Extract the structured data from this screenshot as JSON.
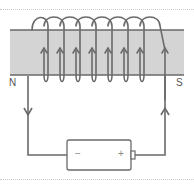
{
  "diagram": {
    "labels": {
      "north": "N",
      "south": "S",
      "negative": "−",
      "positive": "+"
    },
    "coil": {
      "turns": 8,
      "current_direction_front": "up"
    },
    "wires": {
      "left_arrow": "down",
      "right_arrow": "up"
    },
    "colors": {
      "core_fill": "#d4d4d4",
      "wire": "#6a6a6a",
      "battery_fill": "#ffffff",
      "divider": "#c8c8c8"
    }
  }
}
